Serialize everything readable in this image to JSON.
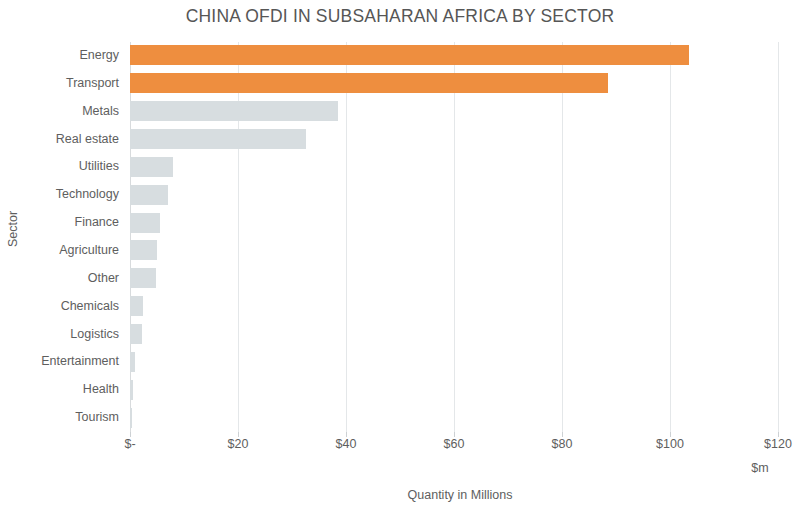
{
  "chart_data": {
    "type": "bar",
    "orientation": "horizontal",
    "title": "CHINA OFDI IN SUBSAHARAN AFRICA BY SECTOR",
    "xlabel": "Quantity in Millions",
    "ylabel": "Sector",
    "x_unit_label": "$m",
    "xlim": [
      0,
      120
    ],
    "grid": true,
    "legend": null,
    "x_ticks": [
      "$-",
      "$20",
      "$40",
      "$60",
      "$80",
      "$100",
      "$120"
    ],
    "x_tick_values": [
      0,
      20,
      40,
      60,
      80,
      100,
      120
    ],
    "categories": [
      "Energy",
      "Transport",
      "Metals",
      "Real estate",
      "Utilities",
      "Technology",
      "Finance",
      "Agriculture",
      "Other",
      "Chemicals",
      "Logistics",
      "Entertainment",
      "Health",
      "Tourism"
    ],
    "values": [
      103.5,
      88.5,
      38.5,
      32.5,
      8.0,
      7.0,
      5.6,
      5.0,
      4.8,
      2.4,
      2.2,
      0.9,
      0.6,
      0.3
    ],
    "bar_colors": [
      "#ee8e3f",
      "#ee8e3f",
      "#d7dde0",
      "#d7dde0",
      "#d7dde0",
      "#d7dde0",
      "#d7dde0",
      "#d7dde0",
      "#d7dde0",
      "#d7dde0",
      "#d7dde0",
      "#d7dde0",
      "#d7dde0",
      "#d7dde0"
    ],
    "colors": {
      "highlight": "#ee8e3f",
      "bar": "#d7dde0",
      "grid": "#e4e7e9",
      "text": "#5e5e5e",
      "background": "#ffffff"
    }
  }
}
